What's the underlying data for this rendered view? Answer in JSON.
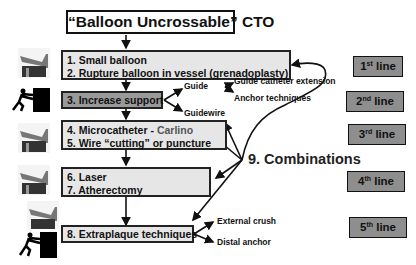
{
  "title": "“Balloon Uncrossable” CTO",
  "steps": [
    {
      "lines": [
        "1. Small balloon",
        "2. Rupture balloon in vessel (grenadoplasty)"
      ],
      "icon": "balloon-device-icon"
    },
    {
      "lines": [
        "3. Increase support"
      ],
      "icon": "pushing-person-icon"
    },
    {
      "line1_prefix": "4. Microcatheter - ",
      "line1_highlight": "Carlino",
      "line2": "5. Wire “cutting” or puncture",
      "icon": "balloon-device-icon"
    },
    {
      "lines": [
        "6. Laser",
        "7. Atherectomy"
      ],
      "icon": "balloon-device-icon"
    },
    {
      "lines": [
        "8. Extraplaque techniques"
      ],
      "icons": [
        "balloon-device-icon",
        "pushing-person-icon"
      ]
    }
  ],
  "support_branches": {
    "guide": "Guide",
    "guide_sub": [
      "Guide catheter extension",
      "Anchor techniques"
    ],
    "guidewire": "Guidewire"
  },
  "extraplaque_branches": [
    "External crush",
    "Distal anchor"
  ],
  "combinations": "9. Combinations",
  "line_badges": [
    {
      "num": "1",
      "sup": "st",
      "text": " line"
    },
    {
      "num": "2",
      "sup": "nd",
      "text": " line"
    },
    {
      "num": "3",
      "sup": "rd",
      "text": " line"
    },
    {
      "num": "4",
      "sup": "th",
      "text": " line"
    },
    {
      "num": "5",
      "sup": "th",
      "text": " line"
    }
  ],
  "colors": {
    "light_box": "#e6e6e6",
    "dark_box": "#9a9a9a",
    "badge": "#8e8e8e",
    "carlino_text": "#555555"
  }
}
